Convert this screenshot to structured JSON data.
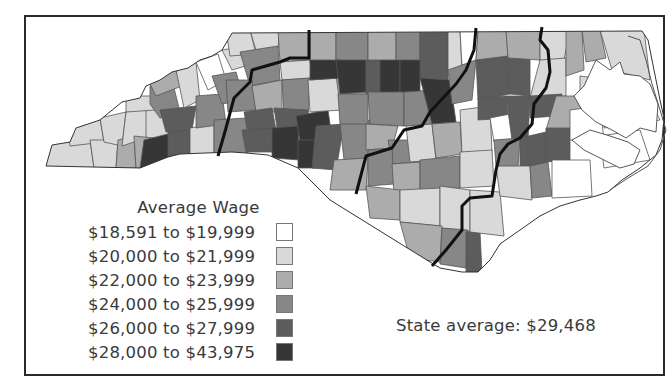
{
  "title": "Average Wage",
  "legend": {
    "title": "Average Wage",
    "items": [
      {
        "label": "$18,591 to $19,999",
        "color": "#ffffff"
      },
      {
        "label": "$20,000 to $21,999",
        "color": "#d9d9d9"
      },
      {
        "label": "$22,000 to $23,999",
        "color": "#acacac"
      },
      {
        "label": "$24,000 to $25,999",
        "color": "#878787"
      },
      {
        "label": "$26,000 to $27,999",
        "color": "#5c5c5c"
      },
      {
        "label": "$28,000 to $43,975",
        "color": "#363636"
      }
    ]
  },
  "state_average": "State average: $29,468",
  "colors": {
    "frame": "#2a2a2a",
    "region_boundary": "#111111",
    "county_border": "#555555",
    "text": "#3a3a3a"
  }
}
